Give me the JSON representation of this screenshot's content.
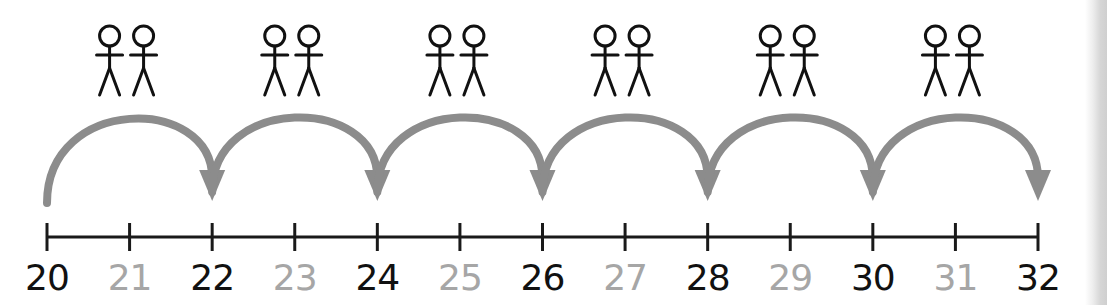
{
  "diagram": {
    "type": "number-line-jumps",
    "start": 20,
    "end": 32,
    "step": 1,
    "jump_size": 2,
    "jumps": [
      {
        "from": 20,
        "to": 22,
        "icon": "pair-of-people-icon"
      },
      {
        "from": 22,
        "to": 24,
        "icon": "pair-of-people-icon"
      },
      {
        "from": 24,
        "to": 26,
        "icon": "pair-of-people-icon"
      },
      {
        "from": 26,
        "to": 28,
        "icon": "pair-of-people-icon"
      },
      {
        "from": 28,
        "to": 30,
        "icon": "pair-of-people-icon"
      },
      {
        "from": 30,
        "to": 32,
        "icon": "pair-of-people-icon"
      }
    ],
    "labels": [
      {
        "value": "20",
        "emphasis": "bold"
      },
      {
        "value": "21",
        "emphasis": "faded"
      },
      {
        "value": "22",
        "emphasis": "bold"
      },
      {
        "value": "23",
        "emphasis": "faded"
      },
      {
        "value": "24",
        "emphasis": "bold"
      },
      {
        "value": "25",
        "emphasis": "faded"
      },
      {
        "value": "26",
        "emphasis": "bold"
      },
      {
        "value": "27",
        "emphasis": "faded"
      },
      {
        "value": "28",
        "emphasis": "bold"
      },
      {
        "value": "29",
        "emphasis": "faded"
      },
      {
        "value": "30",
        "emphasis": "bold"
      },
      {
        "value": "31",
        "emphasis": "faded"
      },
      {
        "value": "32",
        "emphasis": "bold"
      }
    ]
  },
  "colors": {
    "line": "#1a1a1a",
    "arrow": "#8c8c8c",
    "label_bold": "#111111",
    "label_faded": "#a6a6a6",
    "figure": "#111111"
  }
}
